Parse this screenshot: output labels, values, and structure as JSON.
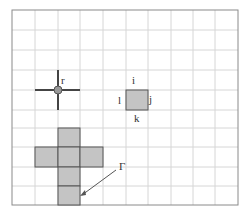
{
  "diagram": {
    "grid": {
      "cols": 10,
      "rows": 10,
      "x0": 12,
      "y0": 10,
      "x1": 238,
      "y1": 205,
      "line_color": "#d6d6d6",
      "border_color": "#8a8a8a"
    },
    "labels": {
      "r": "r",
      "i": "i",
      "j": "j",
      "k": "k",
      "l": "l",
      "gamma": "Γ"
    },
    "colors": {
      "fill": "#c4c4c4",
      "stroke": "#555555",
      "cross": "#444444",
      "dot": "#999999"
    }
  }
}
